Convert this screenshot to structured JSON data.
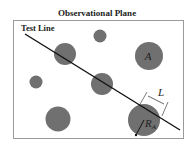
{
  "title": "Observational Plane",
  "test_line_label": "Test Line",
  "area_label": "A",
  "length_label": "L",
  "radius_label": "R",
  "radius_subscript": "A",
  "colors": {
    "circle": "#707070",
    "line": "#111111",
    "frame": "#9a9a9a"
  }
}
